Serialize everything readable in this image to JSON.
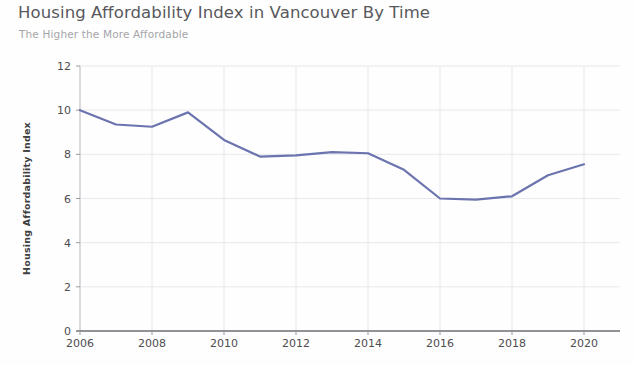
{
  "chart_data": {
    "type": "line",
    "title": "Housing Affordability Index in Vancouver By Time",
    "subtitle": "The Higher the More Affordable",
    "xlabel": "",
    "ylabel": "Housing Affordability Index",
    "x": [
      2006,
      2007,
      2008,
      2009,
      2010,
      2011,
      2012,
      2013,
      2014,
      2015,
      2016,
      2017,
      2018,
      2019,
      2020
    ],
    "values": [
      10.0,
      9.35,
      9.25,
      9.9,
      8.65,
      7.9,
      7.95,
      8.1,
      8.05,
      7.3,
      6.0,
      5.95,
      6.1,
      7.05,
      7.55
    ],
    "series": [
      {
        "name": "Housing Affordability Index",
        "values": [
          10.0,
          9.35,
          9.25,
          9.9,
          8.65,
          7.9,
          7.95,
          8.1,
          8.05,
          7.3,
          6.0,
          5.95,
          6.1,
          7.05,
          7.55
        ],
        "color": "#6b74ae"
      }
    ],
    "xlim": [
      2006,
      2021
    ],
    "ylim": [
      0,
      12
    ],
    "xticks": [
      2006,
      2008,
      2010,
      2012,
      2014,
      2016,
      2018,
      2020
    ],
    "xtick_labels": [
      "2006",
      "2008",
      "2010",
      "2012",
      "2014",
      "2016",
      "2018",
      "2020"
    ],
    "yticks": [
      0,
      2,
      4,
      6,
      8,
      10,
      12
    ],
    "ytick_labels": [
      "0",
      "2",
      "4",
      "6",
      "8",
      "10",
      "12"
    ],
    "grid": true,
    "grid_color": "#e8e8ee",
    "legend": false,
    "legend_position": "none",
    "line_color": "#6b74ae",
    "line_width": 2.2,
    "background": "#fefefe",
    "axis_color": "#8a8a8e"
  }
}
